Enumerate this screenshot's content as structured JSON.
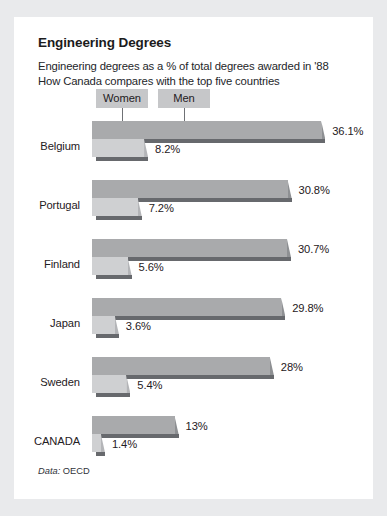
{
  "card": {
    "title": "Engineering Degrees",
    "subtitle": "Engineering degrees as a % of total degrees awarded in '88\nHow Canada compares with the top five countries",
    "source_key": "Data:",
    "source_value": "OECD"
  },
  "legend": {
    "women_label": "Women",
    "men_label": "Men"
  },
  "colors": {
    "page_background": "#e9eaec",
    "card_background": "#ffffff",
    "men_bar": "#a9aaac",
    "women_bar": "#cfd0d2",
    "bar_shadow": "#67696d",
    "legend_box": "#c6c7c9",
    "text": "#1f2023"
  },
  "chart_data": {
    "type": "bar",
    "orientation": "horizontal",
    "title": "Engineering Degrees",
    "subtitle": "Engineering degrees as a % of total degrees awarded in '88 How Canada compares with the top five countries",
    "xlabel": "",
    "ylabel": "",
    "unit": "%",
    "xlim": [
      0,
      40
    ],
    "grid": false,
    "legend_position": "top",
    "source": "Data: OECD",
    "categories": [
      "Belgium",
      "Portugal",
      "Finland",
      "Japan",
      "Sweden",
      "CANADA"
    ],
    "series": [
      {
        "name": "Men",
        "values": [
          36.1,
          30.8,
          30.7,
          29.8,
          28,
          13
        ],
        "labels": [
          "36.1%",
          "30.8%",
          "30.7%",
          "29.8%",
          "28%",
          "13%"
        ]
      },
      {
        "name": "Women",
        "values": [
          8.2,
          7.2,
          5.6,
          3.6,
          5.4,
          1.4
        ],
        "labels": [
          "8.2%",
          "7.2%",
          "5.6%",
          "3.6%",
          "5.4%",
          "1.4%"
        ]
      }
    ]
  }
}
